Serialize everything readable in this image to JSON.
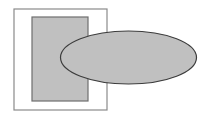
{
  "figure": {
    "title": "Overlapping rectangle and ellipse figure",
    "canvas": {
      "width": 205,
      "height": 119,
      "background_color": "#ffffff"
    },
    "colors": {
      "page_background": "#ffffff",
      "frame_fill": "#ffffff",
      "frame_stroke": "#8a8a8a",
      "shape_fill": "#c0c0c0",
      "rectangle_stroke": "#6e6e6e",
      "ellipse_stroke": "#3c3c3c"
    },
    "shapes": [
      {
        "id": "outer-frame",
        "name": "outer-frame-rectangle",
        "type": "rectangle",
        "fill": "#ffffff",
        "stroke": "#8a8a8a",
        "stroke_width": 1.2,
        "x": 14,
        "y": 9,
        "width": 93,
        "height": 101
      },
      {
        "id": "inner-rectangle",
        "name": "gray-rectangle",
        "type": "rectangle",
        "fill": "#c0c0c0",
        "stroke": "#6e6e6e",
        "stroke_width": 1.2,
        "x": 32,
        "y": 17,
        "width": 56,
        "height": 84
      },
      {
        "id": "ellipse",
        "name": "gray-ellipse",
        "type": "ellipse",
        "fill": "#c0c0c0",
        "stroke": "#3c3c3c",
        "stroke_width": 1.2,
        "cx": 128.5,
        "cy": 57.5,
        "rx": 68,
        "ry": 26.5
      }
    ],
    "notes": {
      "overlap": "Ellipse overlaps the gray rectangle and extends beyond the right edge of the outer frame; both shapes share the same opaque gray fill so the overlap shows no color change.",
      "z_order": "outer-frame, gray-rectangle, gray-ellipse (ellipse on top)"
    }
  }
}
